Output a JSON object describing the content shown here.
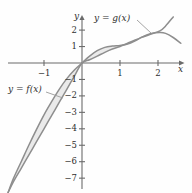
{
  "figure": {
    "background": "#fefefe",
    "curve_color": "#8e8e8e",
    "axis_color": "#6b6b6b",
    "shade_color": "#e9e9e9",
    "text_color": "#2e2e2e"
  },
  "axes": {
    "x_axis_label": "x",
    "y_axis_label": "y",
    "x_ticks": [
      {
        "value": -1,
        "label": "−1"
      },
      {
        "value": 1,
        "label": "1"
      },
      {
        "value": 2,
        "label": "2"
      }
    ],
    "y_ticks": [
      {
        "value": 2,
        "label": "2"
      },
      {
        "value": 1,
        "label": "1"
      },
      {
        "value": -1,
        "label": "−1"
      },
      {
        "value": -2,
        "label": "−2"
      },
      {
        "value": -3,
        "label": "−3"
      },
      {
        "value": -4,
        "label": "−4"
      },
      {
        "value": -5,
        "label": "−5"
      },
      {
        "value": -6,
        "label": "−6"
      },
      {
        "value": -7,
        "label": "−7"
      }
    ]
  },
  "annotations": {
    "g_label": "y = g(x)",
    "f_label": "y = f(x)"
  },
  "chart_data": {
    "type": "line",
    "title": "",
    "xlabel": "x",
    "ylabel": "y",
    "xlim": [
      -2.0,
      2.6
    ],
    "ylim": [
      -7.9,
      2.9
    ],
    "grid": false,
    "legend": "inline-annotations",
    "shaded_regions": [
      {
        "between": [
          "f",
          "g"
        ],
        "from_x": -1.95,
        "to_x": 0.0
      },
      {
        "between": [
          "f",
          "g"
        ],
        "from_x": 0.0,
        "to_x": 2.05
      }
    ],
    "intersections": [
      {
        "x": 0.0,
        "y": 0.0
      },
      {
        "x": 2.05,
        "y": 1.85
      }
    ],
    "series": [
      {
        "name": "f",
        "label": "y = f(x)",
        "x": [
          -1.95,
          -1.8,
          -1.6,
          -1.4,
          -1.2,
          -1.0,
          -0.8,
          -0.6,
          -0.4,
          -0.2,
          0.0,
          0.2,
          0.4,
          0.6,
          0.8,
          1.0,
          1.2,
          1.4,
          1.6,
          1.8,
          2.05,
          2.2,
          2.4,
          2.6
        ],
        "y": [
          -7.9,
          -7.0,
          -6.0,
          -5.0,
          -4.05,
          -3.15,
          -2.35,
          -1.6,
          -0.95,
          -0.42,
          0.0,
          0.42,
          0.75,
          0.95,
          1.03,
          1.07,
          1.15,
          1.35,
          1.6,
          1.78,
          1.85,
          1.8,
          1.55,
          1.2
        ]
      },
      {
        "name": "g",
        "label": "y = g(x)",
        "x": [
          -1.95,
          -1.8,
          -1.6,
          -1.4,
          -1.2,
          -1.0,
          -0.8,
          -0.6,
          -0.4,
          -0.2,
          0.0,
          0.2,
          0.4,
          0.6,
          0.8,
          1.0,
          1.2,
          1.4,
          1.6,
          1.8,
          2.05,
          2.2,
          2.4
        ],
        "y": [
          -7.9,
          -7.2,
          -6.4,
          -5.6,
          -4.8,
          -4.0,
          -3.2,
          -2.4,
          -1.6,
          -0.8,
          0.0,
          0.2,
          0.42,
          0.65,
          0.85,
          1.0,
          1.2,
          1.4,
          1.58,
          1.75,
          1.95,
          2.25,
          2.8
        ]
      }
    ]
  }
}
